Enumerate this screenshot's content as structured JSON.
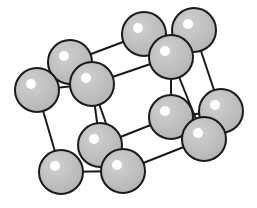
{
  "diagram": {
    "type": "crystal-lattice",
    "colors": {
      "sphere_fill": "#bdbdbd",
      "sphere_stroke": "#1a1a1a",
      "highlight": "#ffffff",
      "bond": "#1a1a1a",
      "background": "#ffffff"
    },
    "sphere_radius": 22,
    "atoms": [
      {
        "id": "a1",
        "x": 144,
        "y": 34
      },
      {
        "id": "a2",
        "x": 194,
        "y": 30
      },
      {
        "id": "a3",
        "x": 171,
        "y": 57
      },
      {
        "id": "a4",
        "x": 70,
        "y": 62
      },
      {
        "id": "a5",
        "x": 37,
        "y": 90
      },
      {
        "id": "a6",
        "x": 92,
        "y": 84
      },
      {
        "id": "a7",
        "x": 171,
        "y": 117
      },
      {
        "id": "a8",
        "x": 221,
        "y": 111
      },
      {
        "id": "a9",
        "x": 204,
        "y": 139
      },
      {
        "id": "a10",
        "x": 100,
        "y": 145
      },
      {
        "id": "a11",
        "x": 61,
        "y": 172
      },
      {
        "id": "a12",
        "x": 123,
        "y": 171
      }
    ],
    "bonds": [
      [
        "a4",
        "a1"
      ],
      [
        "a6",
        "a3"
      ],
      [
        "a5",
        "a6"
      ],
      [
        "a4",
        "a6"
      ],
      [
        "a1",
        "a3"
      ],
      [
        "a2",
        "a3"
      ],
      [
        "a5",
        "a11"
      ],
      [
        "a6",
        "a10"
      ],
      [
        "a6",
        "a12"
      ],
      [
        "a3",
        "a7"
      ],
      [
        "a3",
        "a9"
      ],
      [
        "a2",
        "a8"
      ],
      [
        "a11",
        "a12"
      ],
      [
        "a10",
        "a7"
      ],
      [
        "a12",
        "a9"
      ],
      [
        "a10",
        "a12"
      ],
      [
        "a7",
        "a9"
      ],
      [
        "a8",
        "a9"
      ],
      [
        "a7",
        "a8"
      ]
    ]
  }
}
